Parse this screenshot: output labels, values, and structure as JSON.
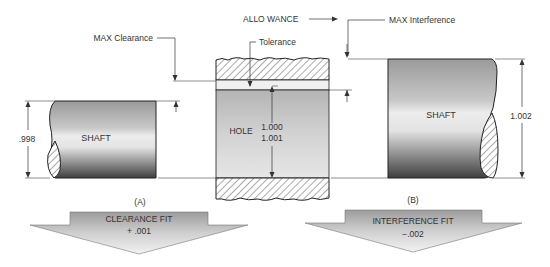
{
  "labels": {
    "max_clearance": "MAX Clearance",
    "allowance": "ALLO WANCE",
    "max_interference": "MAX Interference",
    "tolerance": "Tolerance",
    "hole": "HOLE",
    "hole_dim_1": "1.000",
    "hole_dim_2": "1.001",
    "left_shaft": "SHAFT",
    "left_shaft_dim": ".998",
    "right_shaft": "SHAFT",
    "right_shaft_dim": "1.002",
    "caption_a": "(A)",
    "caption_b": "(B)"
  },
  "arrows": {
    "clearance": {
      "title": "CLEARANCE FIT",
      "value": "+ .001"
    },
    "interference": {
      "title": "INTERFERENCE FIT",
      "value": "−.002"
    }
  },
  "colors": {
    "outline": "#222222",
    "hatch": "#555555",
    "leader": "#333333"
  }
}
